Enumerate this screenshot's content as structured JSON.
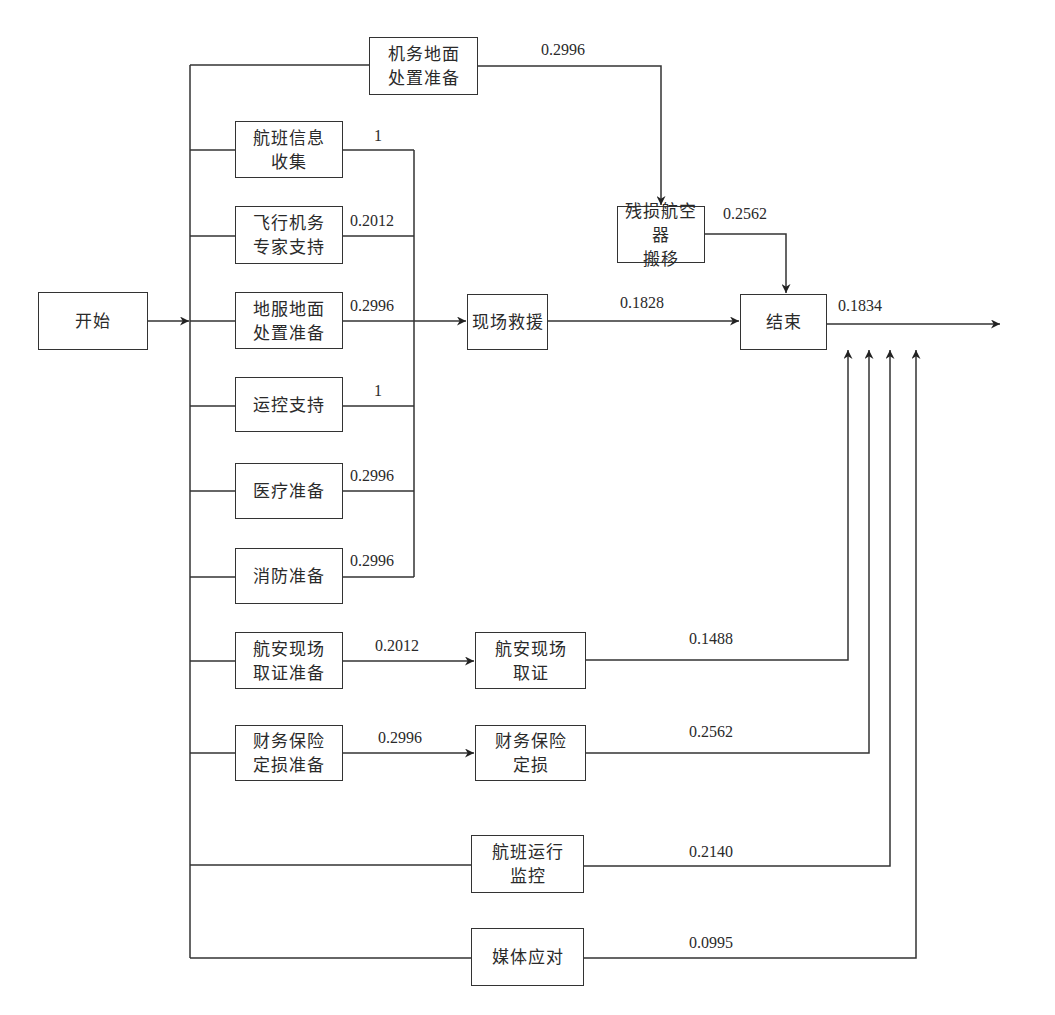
{
  "nodes": {
    "start": "开始",
    "aircraft_ground_prep": "机务地面\n处置准备",
    "flight_info": "航班信息\n收集",
    "flight_expert": "飞行机务\n专家支持",
    "ground_service_prep": "地服地面\n处置准备",
    "ops_support": "运控支持",
    "medical_prep": "医疗准备",
    "fire_prep": "消防准备",
    "safety_evidence_prep": "航安现场\n取证准备",
    "finance_insurance_prep": "财务保险\n定损准备",
    "onsite_rescue": "现场救援",
    "damaged_aircraft_removal": "残损航空器\n搬移",
    "end": "结束",
    "safety_evidence": "航安现场\n取证",
    "finance_insurance": "财务保险\n定损",
    "flight_ops_monitor": "航班运行\n监控",
    "media_response": "媒体应对"
  },
  "edge_labels": {
    "aircraft_ground_prep_out": "0.2996",
    "flight_info_out": "1",
    "flight_expert_out": "0.2012",
    "ground_service_prep_out": "0.2996",
    "ops_support_out": "1",
    "medical_prep_out": "0.2996",
    "fire_prep_out": "0.2996",
    "removal_out": "0.2562",
    "rescue_out": "0.1828",
    "end_out": "0.1834",
    "safety_evidence_prep_out": "0.2012",
    "safety_evidence_out": "0.1488",
    "finance_prep_out": "0.2996",
    "finance_out": "0.2562",
    "flight_ops_monitor_out": "0.2140",
    "media_out": "0.0995"
  }
}
